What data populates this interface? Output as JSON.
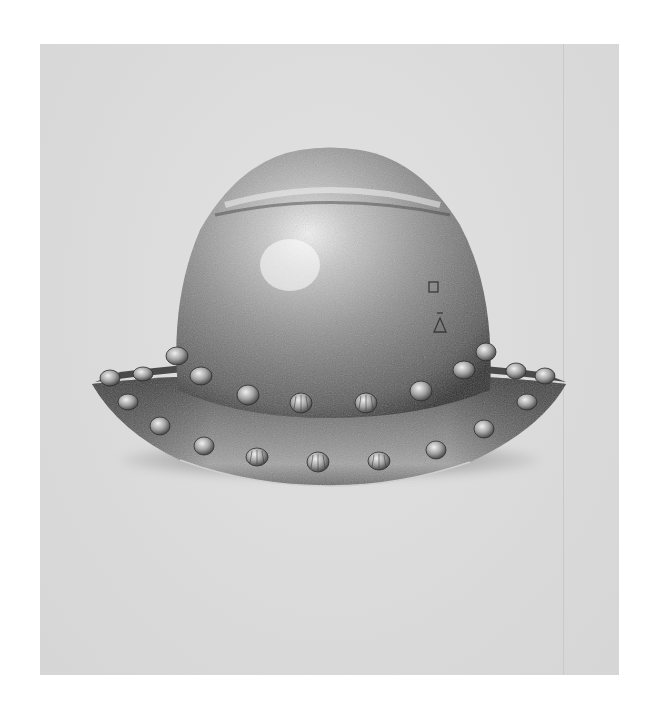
{
  "image": {
    "subject": "steel kettle hat helmet with fluted rivets",
    "background_color": "#dcdcdc",
    "page_color": "#ffffff",
    "metal_colors": {
      "highlight": "#f2f2f2",
      "mid": "#9a9a9a",
      "dark": "#3e3e3e"
    },
    "backdrop": {
      "x": 40,
      "y": 44,
      "width": 579,
      "height": 631
    },
    "divider_x": 563,
    "rivet_count_visible": 24
  }
}
